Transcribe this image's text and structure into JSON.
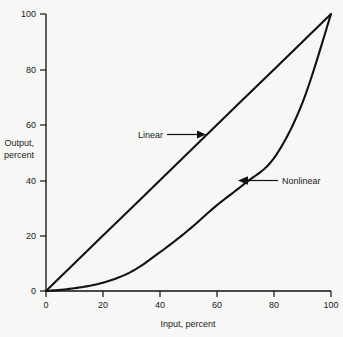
{
  "chart_data": {
    "type": "line",
    "title": "",
    "xlabel": "Input, percent",
    "ylabel": "Output, percent",
    "ylabel_line1": "Output,",
    "ylabel_line2": "percent",
    "xlim": [
      0,
      100
    ],
    "ylim": [
      0,
      100
    ],
    "grid": false,
    "legend": "none",
    "xticks": [
      0,
      20,
      40,
      60,
      80,
      100
    ],
    "yticks": [
      0,
      20,
      40,
      60,
      80,
      100
    ],
    "xtick_labels": [
      "0",
      "20",
      "40",
      "60",
      "80",
      "100"
    ],
    "ytick_labels": [
      "0",
      "20",
      "40",
      "60",
      "80",
      "100"
    ],
    "series": [
      {
        "name": "Linear",
        "x": [
          0,
          10,
          20,
          30,
          40,
          50,
          60,
          70,
          80,
          90,
          100
        ],
        "values": [
          0,
          10,
          20,
          30,
          40,
          50,
          60,
          70,
          80,
          90,
          100
        ]
      },
      {
        "name": "Nonlinear",
        "x": [
          0,
          10,
          20,
          30,
          40,
          50,
          60,
          70,
          80,
          90,
          100
        ],
        "values": [
          0,
          1,
          3,
          7,
          14,
          22,
          31,
          39,
          48,
          68,
          100
        ]
      }
    ],
    "annotations": [
      {
        "label": "Linear",
        "text_x": 43,
        "text_y": 56,
        "arrow_from_x": 53,
        "arrow_from_y": 54,
        "arrow_to_x": 56,
        "arrow_to_y": 54,
        "direction": "right"
      },
      {
        "label": "Nonlinear",
        "text_x": 82,
        "text_y": 41,
        "arrow_from_x": 81,
        "arrow_from_y": 41,
        "arrow_to_x": 67,
        "arrow_to_y": 41,
        "direction": "left"
      }
    ]
  },
  "ticks": {
    "x": {
      "t0": "0",
      "t1": "20",
      "t2": "40",
      "t3": "60",
      "t4": "80",
      "t5": "100"
    },
    "y": {
      "t0": "0",
      "t1": "20",
      "t2": "40",
      "t3": "60",
      "t4": "80",
      "t5": "100"
    }
  },
  "labels": {
    "x_axis": "Input, percent",
    "y_axis_line1": "Output,",
    "y_axis_line2": "percent",
    "linear": "Linear",
    "nonlinear": "Nonlinear"
  },
  "colors": {
    "background": "#f7f7f5",
    "ink": "#111111",
    "text": "#1a1a1a"
  }
}
